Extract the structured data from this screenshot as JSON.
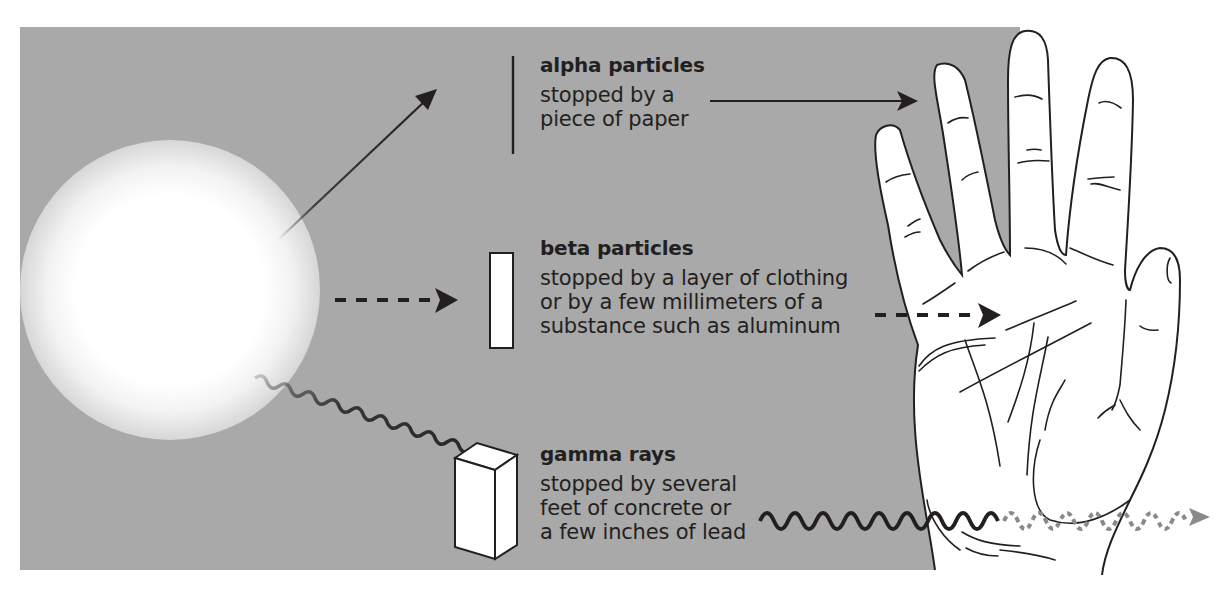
{
  "diagram": {
    "colors": {
      "panel_background": "#a9a9a9",
      "ink": "#231f20",
      "source_glow": "#ffffff",
      "transmitted_wave": "#8a8a8a"
    },
    "source": {
      "icon": "radiation-source-glow"
    },
    "radiation_types": [
      {
        "name": "alpha particles",
        "description": "stopped by a\npiece of paper",
        "barrier": "piece of paper (thin line)",
        "arrow_style": "solid",
        "stops_at": "outside of hand"
      },
      {
        "name": "beta particles",
        "description": "stopped by a layer of clothing\nor by a few millimeters of a\nsubstance such as aluminum",
        "barrier": "thin slab (rectangle)",
        "arrow_style": "dashed",
        "stops_at": "palm of hand"
      },
      {
        "name": "gamma rays",
        "description": "stopped by several\nfeet of concrete or\na few inches of lead",
        "barrier": "thick block (3D box)",
        "arrow_style": "wavy",
        "stops_at": "passes through hand (dotted wave)"
      }
    ],
    "hand": {
      "icon": "hand-outline"
    }
  }
}
